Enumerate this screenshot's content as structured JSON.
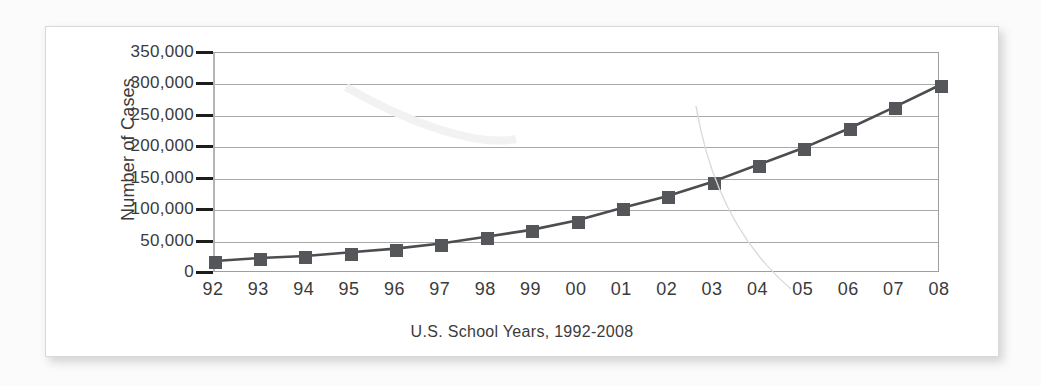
{
  "chart_data": {
    "type": "line",
    "title": "",
    "xlabel": "U.S.  School Years, 1992-2008",
    "ylabel": "Number of Cases",
    "categories": [
      "92",
      "93",
      "94",
      "95",
      "96",
      "97",
      "98",
      "99",
      "00",
      "01",
      "02",
      "03",
      "04",
      "05",
      "06",
      "07",
      "08"
    ],
    "values": [
      16000,
      21000,
      24000,
      30000,
      36000,
      44000,
      55000,
      66000,
      81000,
      101000,
      120000,
      143000,
      170000,
      197000,
      228000,
      262000,
      297000
    ],
    "series": [
      {
        "name": "Number of Cases",
        "values": [
          16000,
          21000,
          24000,
          30000,
          36000,
          44000,
          55000,
          66000,
          81000,
          101000,
          120000,
          143000,
          170000,
          197000,
          228000,
          262000,
          297000
        ]
      }
    ],
    "ylim": [
      0,
      350000
    ],
    "ytick_values": [
      0,
      50000,
      100000,
      150000,
      200000,
      250000,
      300000,
      350000
    ],
    "ytick_labels": [
      "0",
      "50,000",
      "100,000",
      "150,000",
      "200,000",
      "250,000",
      "300,000",
      "350,000"
    ],
    "grid": true,
    "legend": false,
    "marker": "square",
    "colors": {
      "line": "#4c4d50",
      "marker": "#55565a",
      "grid": "#a9a9a9",
      "axis": "#9e9e9e",
      "text": "#3b3b3b",
      "tick": "#1d1d1d",
      "card": "#ffffff",
      "page": "#fbfbfb"
    }
  }
}
